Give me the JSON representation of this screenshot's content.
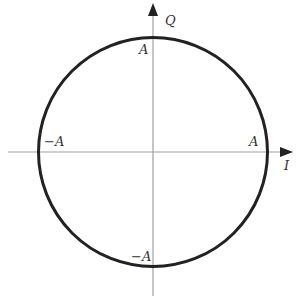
{
  "diagram": {
    "type": "constellation-circle",
    "center": {
      "x": 153,
      "y": 152
    },
    "radius": 114,
    "colors": {
      "circle": "#222222",
      "axis": "#999999",
      "arrow": "#222222",
      "label": "#333333",
      "background": "#ffffff"
    },
    "axes": {
      "horizontal": {
        "label": "I",
        "from_x": 8,
        "to_x": 292
      },
      "vertical": {
        "label": "Q",
        "from_y": 296,
        "to_y": 3
      }
    },
    "labels": {
      "top": "A",
      "bottom": "−A",
      "left": "−A",
      "right": "A",
      "i_axis": "I",
      "q_axis": "Q"
    }
  }
}
